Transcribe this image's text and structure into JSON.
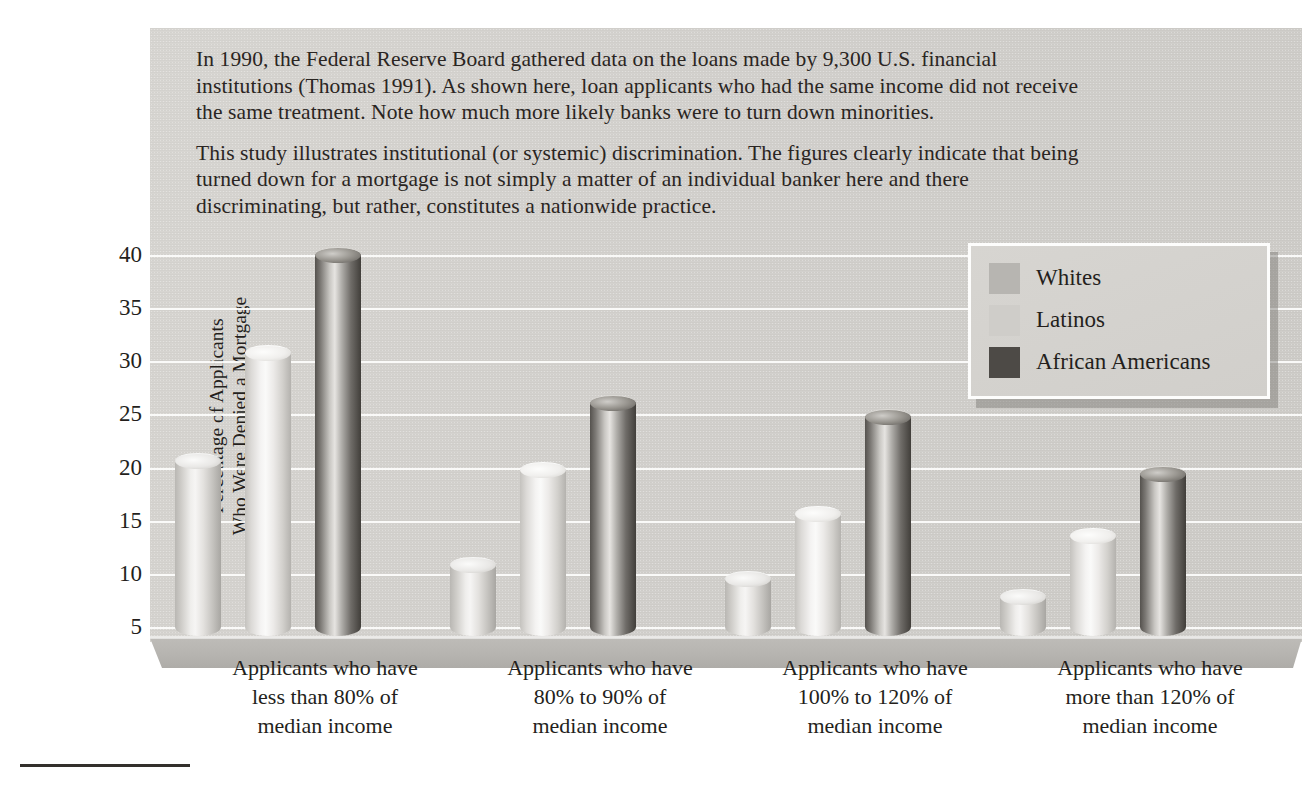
{
  "figure": {
    "caption_paragraphs": [
      "In 1990, the Federal Reserve Board gathered data on the loans made by 9,300 U.S. financial institutions (Thomas 1991). As shown here, loan applicants who had the same income did not receive the same treatment. Note how much more likely banks were to turn down minorities.",
      "This study illustrates institutional (or systemic) discrimination. The figures clearly indicate that being turned down for a mortgage is not simply a matter of an individual banker here and there discriminating, but rather, constitutes a nationwide practice."
    ]
  },
  "chart_data": {
    "type": "bar",
    "title": "",
    "subtitle": "",
    "xlabel": "",
    "ylabel": "Percentage of Applicants\nWho Were Denied a Mortgage",
    "categories": [
      "Applicants who have\nless than 80% of\nmedian income",
      "Applicants who have\n80% to 90% of\nmedian income",
      "Applicants who have\n100% to 120% of\nmedian income",
      "Applicants who have\nmore than 120% of\nmedian income"
    ],
    "series": [
      {
        "name": "Whites",
        "color": "#b7b5b1",
        "values": [
          20.5,
          10.7,
          9.4,
          7.7
        ]
      },
      {
        "name": "Latinos",
        "color": "#cfcdc9",
        "values": [
          30.7,
          19.7,
          15.5,
          13.5
        ]
      },
      {
        "name": "African Americans",
        "color": "#4d4a46",
        "values": [
          39.9,
          26.0,
          24.7,
          19.3
        ]
      }
    ],
    "yticks": [
      40,
      35,
      30,
      25,
      20,
      15,
      10,
      5
    ],
    "ylim": [
      3,
      41
    ],
    "grid": true,
    "legend_position": "top-right",
    "bar_style": "cylinder-3d"
  }
}
